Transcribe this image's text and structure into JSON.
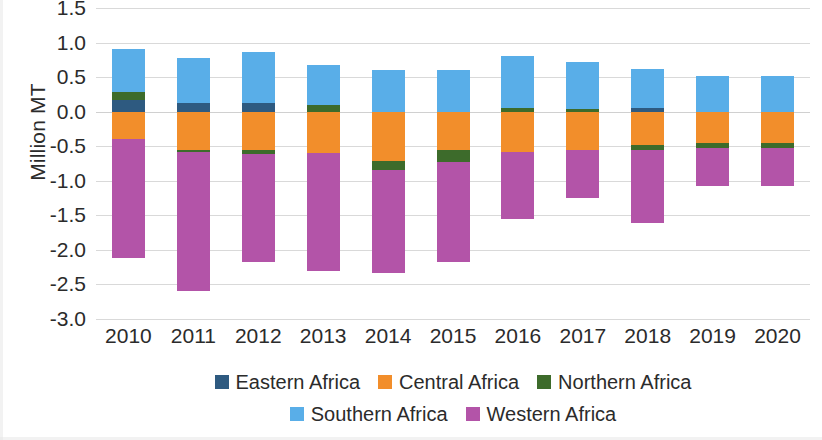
{
  "chart_data": {
    "type": "bar",
    "subtype": "stacked-bar-diverging",
    "title": "",
    "xlabel": "",
    "ylabel": "Million MT",
    "ylim": [
      -3.0,
      1.5
    ],
    "ytick_labels": [
      "1.5",
      "1.0",
      "0.5",
      "0.0",
      "-0.5",
      "-1.0",
      "-1.5",
      "-2.0",
      "-2.5",
      "-3.0"
    ],
    "ytick_values": [
      1.5,
      1.0,
      0.5,
      0.0,
      -0.5,
      -1.0,
      -1.5,
      -2.0,
      -2.5,
      -3.0
    ],
    "grid": true,
    "legend_position": "bottom",
    "categories": [
      "2010",
      "2011",
      "2012",
      "2013",
      "2014",
      "2015",
      "2016",
      "2017",
      "2018",
      "2019",
      "2020"
    ],
    "series": [
      {
        "name": "Eastern Africa",
        "color": "#2E5A80",
        "values": [
          0.17,
          0.12,
          0.13,
          0.0,
          0.0,
          0.0,
          0.0,
          0.0,
          0.05,
          0.0,
          0.0
        ]
      },
      {
        "name": "Central Africa",
        "color": "#F28E2B",
        "values": [
          -0.39,
          -0.55,
          -0.56,
          -0.6,
          -0.72,
          -0.55,
          -0.58,
          -0.55,
          -0.48,
          -0.45,
          -0.45
        ]
      },
      {
        "name": "Northern Africa",
        "color": "#3D6B2B",
        "values": [
          0.11,
          -0.03,
          -0.05,
          0.1,
          -0.12,
          -0.18,
          0.05,
          0.04,
          -0.08,
          -0.07,
          -0.07
        ]
      },
      {
        "name": "Southern Africa",
        "color": "#59AEE8",
        "values": [
          0.63,
          0.65,
          0.73,
          0.58,
          0.6,
          0.6,
          0.75,
          0.68,
          0.57,
          0.52,
          0.52
        ]
      },
      {
        "name": "Western Africa",
        "color": "#B354A8",
        "values": [
          -1.73,
          -2.02,
          -1.56,
          -1.7,
          -1.5,
          -1.45,
          -0.97,
          -0.7,
          -1.05,
          -0.55,
          -0.55
        ]
      }
    ],
    "stack_totals_positive": [
      0.91,
      0.77,
      0.86,
      0.68,
      0.6,
      0.65,
      0.8,
      0.72,
      0.62,
      0.52,
      0.52
    ],
    "stack_totals_negative": [
      -2.12,
      -2.6,
      -2.17,
      -2.3,
      -2.34,
      -2.18,
      -1.55,
      -1.25,
      -1.61,
      -1.07,
      -1.07
    ]
  },
  "axis": {
    "ylabel": "Million MT"
  },
  "legend": {
    "rows": [
      [
        {
          "label": "Eastern Africa",
          "color": "#2E5A80"
        },
        {
          "label": "Central Africa",
          "color": "#F28E2B"
        },
        {
          "label": "Northern Africa",
          "color": "#3D6B2B"
        }
      ],
      [
        {
          "label": "Southern Africa",
          "color": "#59AEE8"
        },
        {
          "label": "Western Africa",
          "color": "#B354A8"
        }
      ]
    ]
  }
}
